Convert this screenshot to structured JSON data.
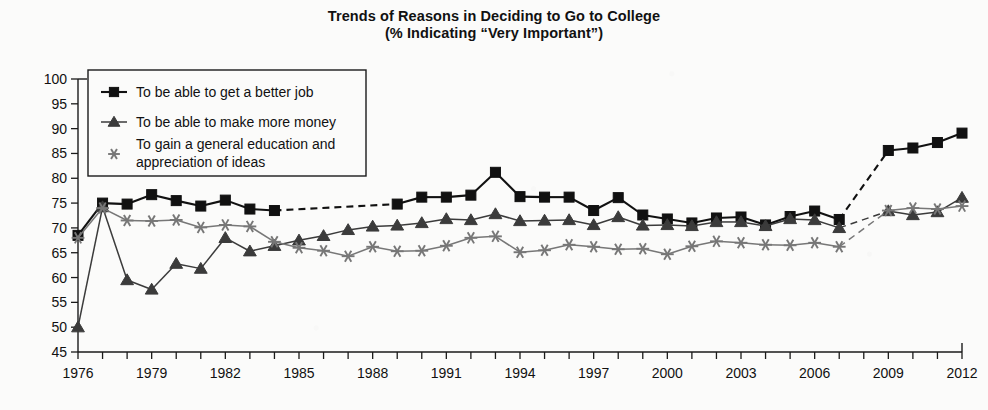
{
  "title": {
    "line1": "Trends of Reasons in Deciding to Go to College",
    "line2": "(% Indicating “Very Important”)"
  },
  "chart_data": {
    "type": "line",
    "title": "Trends of Reasons in Deciding to Go to College (% Indicating “Very Important”)",
    "xlabel": "",
    "ylabel": "% of Students",
    "xlim": [
      1976,
      2012
    ],
    "ylim": [
      45,
      100
    ],
    "yticks": [
      45,
      50,
      55,
      60,
      65,
      70,
      75,
      80,
      85,
      90,
      95,
      100
    ],
    "xticks": [
      1976,
      1977,
      1978,
      1979,
      1980,
      1981,
      1982,
      1983,
      1984,
      1985,
      1986,
      1987,
      1988,
      1989,
      1990,
      1991,
      1992,
      1993,
      1994,
      1995,
      1996,
      1997,
      1998,
      1999,
      2000,
      2001,
      2002,
      2003,
      2004,
      2005,
      2006,
      2007,
      2008,
      2009,
      2010,
      2011,
      2012
    ],
    "xtick_labels": [
      1976,
      1979,
      1982,
      1985,
      1988,
      1991,
      1994,
      1997,
      2000,
      2003,
      2006,
      2009,
      2012
    ],
    "grid": false,
    "legend_position": "upper-left",
    "series": [
      {
        "name": "To be able to get a better job",
        "marker": "square",
        "color": "#111111",
        "points": [
          {
            "x": 1976,
            "y": 68.5
          },
          {
            "x": 1977,
            "y": 75.0
          },
          {
            "x": 1978,
            "y": 74.8
          },
          {
            "x": 1979,
            "y": 76.7
          },
          {
            "x": 1980,
            "y": 75.5
          },
          {
            "x": 1981,
            "y": 74.4
          },
          {
            "x": 1982,
            "y": 75.6
          },
          {
            "x": 1983,
            "y": 73.8
          },
          {
            "x": 1984,
            "y": 73.5
          },
          {
            "x": 1989,
            "y": 74.8
          },
          {
            "x": 1990,
            "y": 76.2
          },
          {
            "x": 1991,
            "y": 76.2
          },
          {
            "x": 1992,
            "y": 76.6
          },
          {
            "x": 1993,
            "y": 81.2
          },
          {
            "x": 1994,
            "y": 76.3
          },
          {
            "x": 1995,
            "y": 76.2
          },
          {
            "x": 1996,
            "y": 76.2
          },
          {
            "x": 1997,
            "y": 73.5
          },
          {
            "x": 1998,
            "y": 76.1
          },
          {
            "x": 1999,
            "y": 72.6
          },
          {
            "x": 2000,
            "y": 71.8
          },
          {
            "x": 2001,
            "y": 71.0
          },
          {
            "x": 2002,
            "y": 72.0
          },
          {
            "x": 2003,
            "y": 72.2
          },
          {
            "x": 2004,
            "y": 70.6
          },
          {
            "x": 2005,
            "y": 72.3
          },
          {
            "x": 2006,
            "y": 73.4
          },
          {
            "x": 2007,
            "y": 71.7
          },
          {
            "x": 2009,
            "y": 85.6
          },
          {
            "x": 2010,
            "y": 86.1
          },
          {
            "x": 2011,
            "y": 87.2
          },
          {
            "x": 2012,
            "y": 89.1
          }
        ],
        "dashed_gaps": [
          [
            1984,
            1989
          ],
          [
            2007,
            2009
          ]
        ]
      },
      {
        "name": "To be able to make more money",
        "marker": "triangle",
        "color": "#3b3b3b",
        "points": [
          {
            "x": 1976,
            "y": 50.0
          },
          {
            "x": 1977,
            "y": 74.2
          },
          {
            "x": 1978,
            "y": 59.5
          },
          {
            "x": 1979,
            "y": 57.6
          },
          {
            "x": 1980,
            "y": 62.8
          },
          {
            "x": 1981,
            "y": 61.8
          },
          {
            "x": 1982,
            "y": 68.0
          },
          {
            "x": 1983,
            "y": 65.3
          },
          {
            "x": 1984,
            "y": 66.4
          },
          {
            "x": 1985,
            "y": 67.5
          },
          {
            "x": 1986,
            "y": 68.4
          },
          {
            "x": 1987,
            "y": 69.6
          },
          {
            "x": 1988,
            "y": 70.3
          },
          {
            "x": 1989,
            "y": 70.5
          },
          {
            "x": 1990,
            "y": 71.0
          },
          {
            "x": 1991,
            "y": 71.8
          },
          {
            "x": 1992,
            "y": 71.6
          },
          {
            "x": 1993,
            "y": 72.8
          },
          {
            "x": 1994,
            "y": 71.4
          },
          {
            "x": 1995,
            "y": 71.5
          },
          {
            "x": 1996,
            "y": 71.6
          },
          {
            "x": 1997,
            "y": 70.6
          },
          {
            "x": 1998,
            "y": 72.2
          },
          {
            "x": 1999,
            "y": 70.5
          },
          {
            "x": 2000,
            "y": 70.6
          },
          {
            "x": 2001,
            "y": 70.4
          },
          {
            "x": 2002,
            "y": 71.2
          },
          {
            "x": 2003,
            "y": 71.2
          },
          {
            "x": 2004,
            "y": 70.4
          },
          {
            "x": 2005,
            "y": 71.8
          },
          {
            "x": 2006,
            "y": 71.6
          },
          {
            "x": 2007,
            "y": 70.0
          },
          {
            "x": 2009,
            "y": 73.4
          },
          {
            "x": 2010,
            "y": 72.6
          },
          {
            "x": 2011,
            "y": 73.2
          },
          {
            "x": 2012,
            "y": 76.1
          }
        ],
        "dashed_gaps": [
          [
            2007,
            2009
          ]
        ]
      },
      {
        "name": "To gain a general education and appreciation of ideas",
        "marker": "asterisk",
        "color": "#777777",
        "points": [
          {
            "x": 1976,
            "y": 68.0
          },
          {
            "x": 1977,
            "y": 74.0
          },
          {
            "x": 1978,
            "y": 71.5
          },
          {
            "x": 1979,
            "y": 71.4
          },
          {
            "x": 1980,
            "y": 71.6
          },
          {
            "x": 1981,
            "y": 70.1
          },
          {
            "x": 1982,
            "y": 70.6
          },
          {
            "x": 1983,
            "y": 70.3
          },
          {
            "x": 1984,
            "y": 67.2
          },
          {
            "x": 1985,
            "y": 66.0
          },
          {
            "x": 1986,
            "y": 65.4
          },
          {
            "x": 1987,
            "y": 64.3
          },
          {
            "x": 1988,
            "y": 66.2
          },
          {
            "x": 1989,
            "y": 65.3
          },
          {
            "x": 1990,
            "y": 65.4
          },
          {
            "x": 1991,
            "y": 66.4
          },
          {
            "x": 1992,
            "y": 68.0
          },
          {
            "x": 1993,
            "y": 68.3
          },
          {
            "x": 1994,
            "y": 65.1
          },
          {
            "x": 1995,
            "y": 65.5
          },
          {
            "x": 1996,
            "y": 66.6
          },
          {
            "x": 1997,
            "y": 66.2
          },
          {
            "x": 1998,
            "y": 65.7
          },
          {
            "x": 1999,
            "y": 65.8
          },
          {
            "x": 2000,
            "y": 64.7
          },
          {
            "x": 2001,
            "y": 66.3
          },
          {
            "x": 2002,
            "y": 67.3
          },
          {
            "x": 2003,
            "y": 67.0
          },
          {
            "x": 2004,
            "y": 66.6
          },
          {
            "x": 2005,
            "y": 66.5
          },
          {
            "x": 2006,
            "y": 67.0
          },
          {
            "x": 2007,
            "y": 66.2
          },
          {
            "x": 2009,
            "y": 73.5
          },
          {
            "x": 2010,
            "y": 74.0
          },
          {
            "x": 2011,
            "y": 73.8
          },
          {
            "x": 2012,
            "y": 74.4
          }
        ],
        "dashed_gaps": [
          [
            2007,
            2009
          ]
        ]
      }
    ]
  },
  "legend": {
    "items": [
      {
        "label": "To be able to get a better job",
        "marker": "square",
        "color": "#111111"
      },
      {
        "label": "To be able to make more money",
        "marker": "triangle",
        "color": "#3b3b3b"
      },
      {
        "label": "To gain a general education and",
        "label2": "appreciation of ideas",
        "marker": "asterisk",
        "color": "#777777"
      }
    ]
  }
}
